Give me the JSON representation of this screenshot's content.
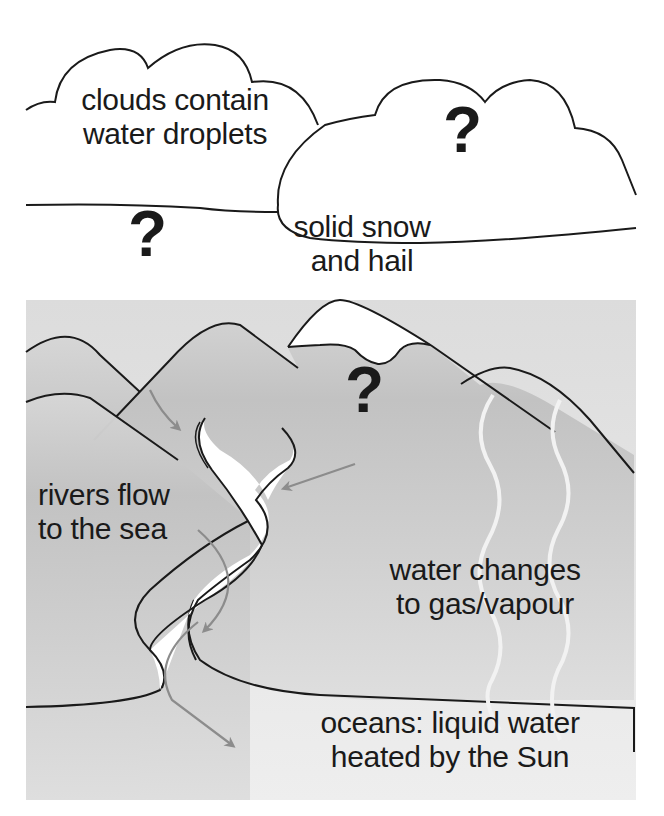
{
  "diagram": {
    "labels": {
      "clouds": [
        "clouds contain",
        "water droplets"
      ],
      "snow": [
        "solid snow",
        "and hail"
      ],
      "rivers": [
        "rivers flow",
        "to the sea"
      ],
      "evaporation": [
        "water changes",
        "to gas/vapour"
      ],
      "oceans": [
        "oceans: liquid water",
        "heated by the Sun"
      ]
    },
    "unknowns": [
      {
        "id": "cloud-right",
        "text": "?"
      },
      {
        "id": "sky-left",
        "text": "?"
      },
      {
        "id": "mountain",
        "text": "?"
      }
    ],
    "colors": {
      "outline": "#1a1a1a",
      "land": "#c4c4c4",
      "land_light": "#d8d8d8",
      "ocean": "#e6e6e6",
      "arrow": "#8c8c8c",
      "vapour": "#efefef"
    }
  }
}
